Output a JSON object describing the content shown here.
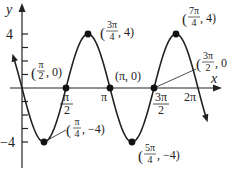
{
  "chart_data": {
    "type": "line",
    "title": "",
    "function": "y = -4 sin(2x)",
    "xlabel": "x",
    "ylabel": "y",
    "x_ticks": [
      "π/2",
      "π",
      "3π/2",
      "2π"
    ],
    "y_ticks": [
      "4",
      "-4"
    ],
    "xlim": [
      -0.4,
      6.6
    ],
    "ylim": [
      -6,
      6.4
    ],
    "grid": false,
    "points": [
      {
        "x": "π/4",
        "y": -4,
        "label": "(π/4, −4)"
      },
      {
        "x": "π/2",
        "y": 0,
        "label": "(π/2, 0)"
      },
      {
        "x": "3π/4",
        "y": 4,
        "label": "(3π/4, 4)"
      },
      {
        "x": "π",
        "y": 0,
        "label": "(π, 0)"
      },
      {
        "x": "5π/4",
        "y": -4,
        "label": "(5π/4, −4)"
      },
      {
        "x": "3π/2",
        "y": 0,
        "label": "(3π/2, 0)"
      },
      {
        "x": "7π/4",
        "y": 4,
        "label": "(7π/4, 4)"
      }
    ]
  },
  "axes": {
    "x_label": "x",
    "y_label": "y",
    "tick_pi2": "π",
    "tick_pi2_den": "2",
    "tick_pi": "π",
    "tick_3pi2_num": "3π",
    "tick_3pi2_den": "2",
    "tick_2pi": "2π",
    "tick_4": "4",
    "tick_neg4": "−4"
  },
  "labels": {
    "p_pi2": {
      "open": "(",
      "num": "π",
      "den": "2",
      "rest": ", 0)"
    },
    "p_3pi4": {
      "open": "(",
      "num": "3π",
      "den": "4",
      "rest": ", 4)"
    },
    "p_7pi4": {
      "open": "(",
      "num": "7π",
      "den": "4",
      "rest": ", 4)"
    },
    "p_pi": "(π, 0)",
    "p_3pi2": {
      "open": "(",
      "num": "3π",
      "den": "2",
      "rest": ", 0"
    },
    "p_pi4": {
      "open": "(",
      "num": "π",
      "den": "4",
      "rest": ", −4)"
    },
    "p_5pi4": {
      "open": "(",
      "num": "5π",
      "den": "4",
      "rest": ", −4)"
    }
  },
  "colors": {
    "curve": "#222222",
    "axis": "#222222",
    "point": "#111111"
  }
}
